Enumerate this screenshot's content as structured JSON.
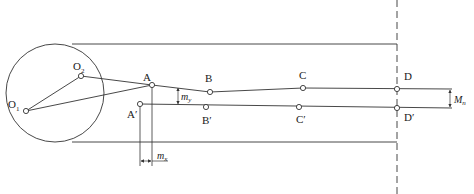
{
  "diagram": {
    "type": "mechanism-linkage-offset",
    "colors": {
      "line": "#333333",
      "background": "#ffffff"
    },
    "circle": {
      "cx": 55,
      "cy": 93,
      "r": 49
    },
    "tangent_lines": {
      "top_y": 44,
      "bottom_y": 142,
      "x_start": 72,
      "x_end": 397
    },
    "dashed_line": {
      "x": 397,
      "y_start": 0,
      "y_end": 194
    },
    "points": {
      "O1": {
        "label": "O",
        "sub": "1",
        "x": 26,
        "y": 111
      },
      "O2": {
        "label": "O",
        "sub": "2",
        "x": 81,
        "y": 76
      },
      "A": {
        "label": "A",
        "x": 152,
        "y": 85
      },
      "B": {
        "label": "B",
        "x": 210,
        "y": 92
      },
      "C": {
        "label": "C",
        "x": 303,
        "y": 88
      },
      "D": {
        "label": "D",
        "x": 397,
        "y": 89
      },
      "A_prime": {
        "label": "A′",
        "x": 140,
        "y": 104
      },
      "B_prime": {
        "label": "B′",
        "x": 206,
        "y": 107
      },
      "C_prime": {
        "label": "C′",
        "x": 299,
        "y": 107
      },
      "D_prime": {
        "label": "D′",
        "x": 397,
        "y": 108
      }
    },
    "dimensions": {
      "m_y": {
        "label": "m",
        "sub": "y"
      },
      "m_x": {
        "label": "m",
        "sub": "x"
      },
      "M_n": {
        "label": "M",
        "sub": "n"
      }
    }
  }
}
